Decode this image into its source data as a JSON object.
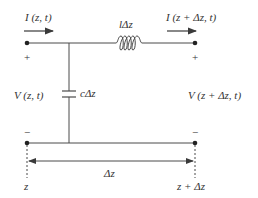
{
  "diagram": {
    "type": "transmission-line-equivalent-circuit",
    "colors": {
      "wire": "#4a4a4a",
      "text": "#333333",
      "background": "#ffffff"
    },
    "labels": {
      "current_in": "I (z, t)",
      "current_out": "I (z + Δz, t)",
      "inductor": "lΔz",
      "capacitor": "cΔz",
      "voltage_in": "V (z, t)",
      "voltage_out": "V (z + Δz, t)",
      "plus_left": "+",
      "plus_right": "+",
      "minus_left": "−",
      "minus_right": "−",
      "length": "Δz",
      "position_left": "z",
      "position_right": "z + Δz"
    },
    "components": [
      {
        "type": "inductor",
        "label": "lΔz",
        "position": "series-top"
      },
      {
        "type": "capacitor",
        "label": "cΔz",
        "position": "shunt"
      }
    ]
  }
}
